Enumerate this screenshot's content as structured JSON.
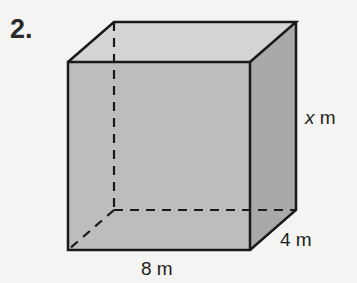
{
  "problem": {
    "number": "2."
  },
  "figure": {
    "type": "rectangular prism",
    "colors": {
      "front_face": "#bdbdbd",
      "top_face": "#d4d4d4",
      "side_face": "#a9a9a9",
      "edge": "#1a1a1a"
    },
    "labels": {
      "height_var": "x",
      "height_unit": " m",
      "depth": "4 m",
      "width": "8 m"
    }
  }
}
